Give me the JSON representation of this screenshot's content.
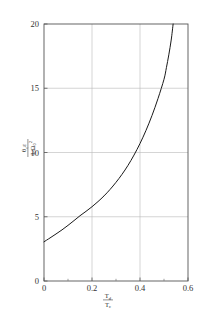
{
  "chart_data": {
    "type": "line",
    "title": "",
    "subtitle": "",
    "xlabel": "T_d / T_c",
    "xlabel_numerator": "T",
    "xlabel_numerator_sub": "d",
    "xlabel_denominator": "T",
    "xlabel_denominator_sub": "c",
    "ylabel": "theta_c * epsilon / (I_0 * Omega_0^2)",
    "ylabel_numerator": "θ",
    "ylabel_numerator_sub": "c",
    "ylabel_numerator_2": "ε",
    "ylabel_denominator": "I",
    "ylabel_denominator_sub": "0",
    "ylabel_denominator_2": "Ω",
    "ylabel_denominator_2_sub": "0",
    "ylabel_denominator_2_sup": "2",
    "xlim": [
      0,
      0.6
    ],
    "ylim": [
      0,
      20
    ],
    "xticks": [
      0,
      0.2,
      0.4,
      0.6
    ],
    "xticklabels": [
      "0",
      "0.2",
      "0.4",
      "0.6"
    ],
    "yticks": [
      0,
      5,
      10,
      15,
      20
    ],
    "yticklabels": [
      "0",
      "5",
      "10",
      "15",
      "20"
    ],
    "x_minor_ticks": [
      0.1,
      0.3,
      0.5
    ],
    "grid": true,
    "grid_color": "#b9b9b9",
    "legend": null,
    "legend_position": "none",
    "line_color": "#1a1a1a",
    "line_width": 1.0,
    "series": [
      {
        "name": "curve",
        "x": [
          0.0,
          0.02,
          0.04,
          0.06,
          0.08,
          0.1,
          0.12,
          0.14,
          0.16,
          0.18,
          0.2,
          0.22,
          0.24,
          0.26,
          0.28,
          0.3,
          0.32,
          0.34,
          0.36,
          0.38,
          0.4,
          0.42,
          0.44,
          0.46,
          0.48,
          0.5,
          0.52
        ],
        "y": [
          3.05,
          3.28,
          3.52,
          3.78,
          4.05,
          4.33,
          4.63,
          4.95,
          5.28,
          5.1,
          5.65,
          6.05,
          6.5,
          7.0,
          7.55,
          8.15,
          8.85,
          9.6,
          10.45,
          11.4,
          12.45,
          13.6,
          14.85,
          16.2,
          17.65,
          19.0,
          20.0
        ]
      }
    ],
    "curve_points": [
      [
        0.0,
        3.05
      ],
      [
        0.025,
        3.35
      ],
      [
        0.05,
        3.66
      ],
      [
        0.075,
        3.98
      ],
      [
        0.1,
        4.33
      ],
      [
        0.125,
        4.7
      ],
      [
        0.15,
        5.08
      ],
      [
        0.175,
        5.42
      ],
      [
        0.2,
        5.78
      ],
      [
        0.225,
        6.18
      ],
      [
        0.25,
        6.62
      ],
      [
        0.275,
        7.12
      ],
      [
        0.3,
        7.68
      ],
      [
        0.325,
        8.3
      ],
      [
        0.35,
        9.0
      ],
      [
        0.375,
        9.8
      ],
      [
        0.4,
        10.7
      ],
      [
        0.425,
        11.72
      ],
      [
        0.45,
        12.88
      ],
      [
        0.475,
        14.2
      ],
      [
        0.5,
        15.7
      ],
      [
        0.51,
        16.6
      ],
      [
        0.52,
        17.6
      ],
      [
        0.53,
        18.75
      ],
      [
        0.538,
        20.0
      ]
    ]
  },
  "figure": {
    "background": "#ffffff",
    "frame_color": "#4a4a4a"
  }
}
